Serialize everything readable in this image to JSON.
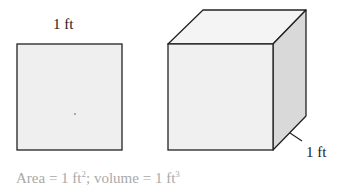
{
  "figure": {
    "square": {
      "side_label": "1 ft",
      "fill": "#efefef",
      "stroke": "#222222"
    },
    "cube": {
      "depth_label": "1 ft",
      "front_fill": "#f0f0f0",
      "top_fill": "#f4f4f4",
      "side_fill": "#d9d9d9",
      "stroke": "#222222"
    },
    "caption": {
      "area_text": "Area = 1 ft",
      "area_exp": "2",
      "separator": "; volume = 1 ft",
      "volume_exp": "3",
      "color": "#a9a9a9"
    }
  }
}
